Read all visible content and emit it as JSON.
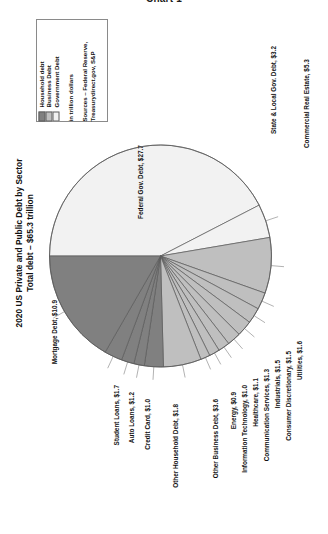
{
  "document": {
    "heading": "Chart 1"
  },
  "chart_title": {
    "line1": "2020 US Private and Public Debt by Sector",
    "line2": "Total debt – $65.3 trillion"
  },
  "legend": {
    "entries": [
      {
        "label": "Household debt",
        "color": "#808080"
      },
      {
        "label": "Business Debt",
        "color": "#bfbfbf"
      },
      {
        "label": "Government Debt",
        "color": "#f2f2f2"
      }
    ],
    "units_note": "in trillion dollars",
    "sources_line1": "Sources – Federal Reserve,",
    "sources_line2": "Treasurydirect.gov, S&P"
  },
  "chart_data": {
    "type": "pie",
    "title": "2020 US Private and Public Debt by Sector",
    "subtitle": "Total debt – $65.3 trillion",
    "units": "trillion dollars",
    "total": 65.3,
    "sources": "Federal Reserve, Treasurydirect.gov, S&P",
    "legend_position": "top-left",
    "grid": false,
    "groups": [
      {
        "name": "Government Debt",
        "color": "#f2f2f2"
      },
      {
        "name": "Business Debt",
        "color": "#bfbfbf"
      },
      {
        "name": "Household debt",
        "color": "#808080"
      }
    ],
    "categories": [
      "Federal Gov. Debt",
      "State & Local Gov. Debt",
      "Commercial Real Estate",
      "Utilities",
      "Consumer Discretionary",
      "Industrials",
      "Communication Services",
      "Healthcare",
      "Information Technology",
      "Energy",
      "Other Business Debt",
      "Other Household Debt",
      "Credit Card",
      "Auto Loans",
      "Student Loans",
      "Mortgage Debt"
    ],
    "values": [
      27.7,
      3.2,
      5.3,
      1.6,
      1.5,
      1.5,
      1.3,
      1.1,
      1.0,
      0.9,
      3.6,
      1.8,
      1.0,
      1.2,
      1.7,
      10.9
    ],
    "slices": [
      {
        "label": "Federal Gov. Debt, $27.7",
        "name": "Federal Gov. Debt",
        "value": 27.7,
        "group": "Government Debt",
        "color": "#f2f2f2"
      },
      {
        "label": "State & Local Gov. Debt, $3.2",
        "name": "State & Local Gov. Debt",
        "value": 3.2,
        "group": "Government Debt",
        "color": "#f2f2f2"
      },
      {
        "label": "Commercial Real Estate, $5.3",
        "name": "Commercial Real Estate",
        "value": 5.3,
        "group": "Business Debt",
        "color": "#bfbfbf"
      },
      {
        "label": "Utilities, $1.6",
        "name": "Utilities",
        "value": 1.6,
        "group": "Business Debt",
        "color": "#bfbfbf"
      },
      {
        "label": "Consumer Discretionary, $1.5",
        "name": "Consumer Discretionary",
        "value": 1.5,
        "group": "Business Debt",
        "color": "#bfbfbf"
      },
      {
        "label": "Industrials, $1.5",
        "name": "Industrials",
        "value": 1.5,
        "group": "Business Debt",
        "color": "#bfbfbf"
      },
      {
        "label": "Communication Services, $1.3",
        "name": "Communication Services",
        "value": 1.3,
        "group": "Business Debt",
        "color": "#bfbfbf"
      },
      {
        "label": "Healthcare, $1.1",
        "name": "Healthcare",
        "value": 1.1,
        "group": "Business Debt",
        "color": "#bfbfbf"
      },
      {
        "label": "Information Technology, $1.0",
        "name": "Information Technology",
        "value": 1.0,
        "group": "Business Debt",
        "color": "#bfbfbf"
      },
      {
        "label": "Energy, $0.9",
        "name": "Energy",
        "value": 0.9,
        "group": "Business Debt",
        "color": "#bfbfbf"
      },
      {
        "label": "Other Business Debt, $3.6",
        "name": "Other Business Debt",
        "value": 3.6,
        "group": "Business Debt",
        "color": "#bfbfbf"
      },
      {
        "label": "Other Household Debt, $1.8",
        "name": "Other Household Debt",
        "value": 1.8,
        "group": "Household debt",
        "color": "#808080"
      },
      {
        "label": "Credit Card, $1.0",
        "name": "Credit Card",
        "value": 1.0,
        "group": "Household debt",
        "color": "#808080"
      },
      {
        "label": "Auto Loans, $1.2",
        "name": "Auto Loans",
        "value": 1.2,
        "group": "Household debt",
        "color": "#808080"
      },
      {
        "label": "Student Loans, $1.7",
        "name": "Student Loans",
        "value": 1.7,
        "group": "Household debt",
        "color": "#808080"
      },
      {
        "label": "Mortgage Debt, $10.9",
        "name": "Mortgage Debt",
        "value": 10.9,
        "group": "Household debt",
        "color": "#808080"
      }
    ]
  }
}
